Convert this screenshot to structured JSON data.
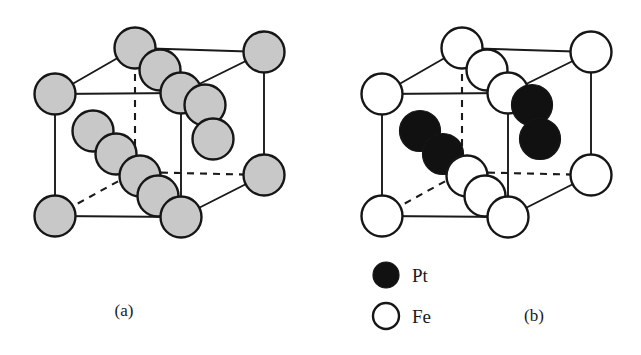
{
  "figure": {
    "background_color": "#ffffff",
    "width": 641,
    "height": 355
  },
  "colors": {
    "atom_gray_fill": "#c8c8c8",
    "atom_white_fill": "#ffffff",
    "atom_black_fill": "#111111",
    "atom_outline": "#161616",
    "bond_line": "#1a1a1a",
    "text": "#1a1a1a"
  },
  "panels": [
    {
      "id": "panel-a",
      "caption": "(a)",
      "caption_x": 124,
      "caption_y": 316,
      "origin_x": 0,
      "atom_style": "gray",
      "description": "Disordered face centred cubic solid solution, all sites equivalent"
    },
    {
      "id": "panel-b",
      "caption": "(b)",
      "caption_x": 534,
      "caption_y": 321,
      "origin_x": 327,
      "atom_style": "two-species",
      "description": "Ordered L1 0 structure with alternating Fe and Pt layers"
    }
  ],
  "legend": {
    "items": [
      {
        "label": "Pt",
        "marker": "filled-circle",
        "fill": "#111111",
        "cx": 386,
        "cy": 275,
        "r": 13,
        "label_x": 412,
        "label_y": 282
      },
      {
        "label": "Fe",
        "marker": "open-circle",
        "fill": "#ffffff",
        "cx": 386,
        "cy": 316,
        "r": 13,
        "label_x": 412,
        "label_y": 323
      }
    ]
  },
  "geometry": {
    "atom_radius": 20.5,
    "vertices": {
      "front_top_left": {
        "x": 55,
        "y": 94
      },
      "front_bottom_left": {
        "x": 55,
        "y": 216
      },
      "front_top_right": {
        "x": 181,
        "y": 93
      },
      "front_bottom_right": {
        "x": 181,
        "y": 217
      },
      "back_top_left": {
        "x": 135,
        "y": 48
      },
      "back_top_right": {
        "x": 264,
        "y": 52
      },
      "back_bottom_right": {
        "x": 264,
        "y": 175
      },
      "back_bottom_left": {
        "x": 135,
        "y": 172
      }
    },
    "solid_edges": [
      {
        "from": "front_top_left",
        "to": "front_top_right"
      },
      {
        "from": "front_top_left",
        "to": "front_bottom_left"
      },
      {
        "from": "front_bottom_left",
        "to": "front_bottom_right"
      },
      {
        "from": "front_top_right",
        "to": "front_bottom_right"
      },
      {
        "from": "front_top_left",
        "to": "back_top_left"
      },
      {
        "from": "back_top_left",
        "to": "back_top_right"
      },
      {
        "from": "front_top_right",
        "to": "back_top_right"
      },
      {
        "from": "back_top_right",
        "to": "back_bottom_right"
      },
      {
        "from": "front_bottom_right",
        "to": "back_bottom_right"
      }
    ],
    "dashed_edges": [
      {
        "from": "back_top_left",
        "to": "back_bottom_left"
      },
      {
        "from": "back_bottom_left",
        "to": "back_bottom_right"
      },
      {
        "from": "front_bottom_left",
        "to": "back_bottom_left"
      }
    ],
    "corner_atoms": [
      {
        "name": "corner-front-top-left",
        "x": 55,
        "y": 94,
        "species_a": "gray",
        "species_b": "Fe"
      },
      {
        "name": "corner-front-bottom-left",
        "x": 55,
        "y": 216,
        "species_a": "gray",
        "species_b": "Fe"
      },
      {
        "name": "corner-back-top-left",
        "x": 135,
        "y": 48,
        "species_a": "gray",
        "species_b": "Fe"
      },
      {
        "name": "corner-back-top-right",
        "x": 264,
        "y": 52,
        "species_a": "gray",
        "species_b": "Fe"
      },
      {
        "name": "corner-front-top-right",
        "x": 181,
        "y": 93,
        "species_a": "gray",
        "species_b": "Fe"
      },
      {
        "name": "corner-back-bottom-right",
        "x": 264,
        "y": 175,
        "species_a": "gray",
        "species_b": "Fe"
      },
      {
        "name": "corner-front-bottom-right",
        "x": 181,
        "y": 217,
        "species_a": "gray",
        "species_b": "Fe"
      }
    ],
    "face_atoms": [
      {
        "name": "face-top",
        "x": 160,
        "y": 70,
        "species_a": "gray",
        "species_b": "Fe"
      },
      {
        "name": "face-upper-mid",
        "x": 205,
        "y": 105,
        "species_a": "gray",
        "species_b": "Pt"
      },
      {
        "name": "face-right",
        "x": 213,
        "y": 139,
        "species_a": "gray",
        "species_b": "Pt"
      },
      {
        "name": "face-inner-upper",
        "x": 93,
        "y": 131,
        "species_a": "gray",
        "species_b": "Pt"
      },
      {
        "name": "face-inner-mid",
        "x": 116,
        "y": 154,
        "species_a": "gray",
        "species_b": "Pt"
      },
      {
        "name": "face-inner-lower",
        "x": 140,
        "y": 176,
        "species_a": "gray",
        "species_b": "Fe"
      },
      {
        "name": "face-bottom-inner",
        "x": 158,
        "y": 196,
        "species_a": "gray",
        "species_b": "Fe"
      }
    ],
    "draw_order_a": [
      "face-inner-upper",
      "face-inner-mid",
      "face-inner-lower",
      "face-bottom-inner",
      "corner-front-top-left",
      "corner-front-bottom-left",
      "corner-back-top-left",
      "corner-back-top-right",
      "corner-back-bottom-right",
      "face-top",
      "corner-front-top-right",
      "face-upper-mid",
      "face-right",
      "corner-front-bottom-right"
    ],
    "draw_order_b": [
      "face-inner-upper",
      "face-inner-mid",
      "face-inner-lower",
      "face-bottom-inner",
      "corner-front-top-left",
      "corner-front-bottom-left",
      "corner-back-top-left",
      "corner-back-top-right",
      "corner-back-bottom-right",
      "face-top",
      "corner-front-top-right",
      "face-upper-mid",
      "face-right",
      "corner-front-bottom-right"
    ]
  }
}
